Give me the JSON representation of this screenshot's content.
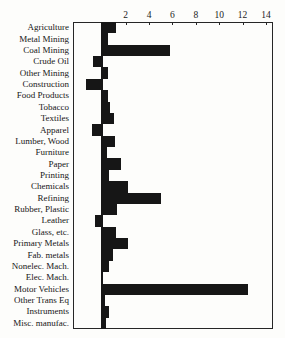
{
  "chart_data": {
    "type": "bar",
    "orientation": "horizontal",
    "categories": [
      "Agriculture",
      "Metal Mining",
      "Coal Mining",
      "Crude Oil",
      "Other Mining",
      "Construction",
      "Food Products",
      "Tobacco",
      "Textiles",
      "Apparel",
      "Lumber, Wood",
      "Furniture",
      "Paper",
      "Printing",
      "Chemicals",
      "Refining",
      "Rubber, Plastic",
      "Leather",
      "Glass, etc.",
      "Primary Metals",
      "Fab. metals",
      "Nonelec. Mach.",
      "Elec. Mach.",
      "Motor Vehicles",
      "Other Trans Eq",
      "Instruments",
      "Misc. manufac."
    ],
    "values": [
      1.2,
      0.5,
      5.8,
      -0.8,
      0.5,
      -1.4,
      0.5,
      0.7,
      1.0,
      -0.9,
      1.1,
      0.4,
      1.6,
      0.6,
      2.2,
      5.0,
      1.3,
      -0.6,
      1.2,
      2.2,
      0.9,
      0.6,
      0.1,
      12.5,
      0.2,
      0.6,
      0.3
    ],
    "x_tick_labels": [
      "2",
      "4",
      "6",
      "8",
      "10",
      "12",
      "14"
    ],
    "x_tick_values": [
      2,
      4,
      6,
      8,
      10,
      12,
      14
    ],
    "xlim": [
      -2.5,
      14.6
    ],
    "grid": "off",
    "legend": "none",
    "bar_color": "#161616",
    "frame_color": "#262626",
    "background_color": "#fdfdfb"
  }
}
